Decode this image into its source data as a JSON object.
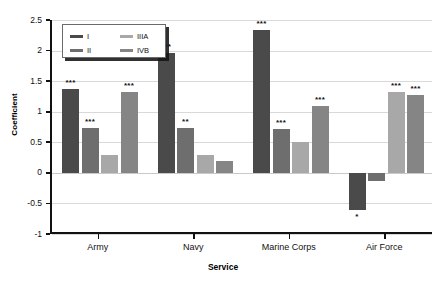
{
  "chart_data": {
    "type": "bar",
    "title": "",
    "xlabel": "Service",
    "ylabel": "Coefficient",
    "categories": [
      "Army",
      "Navy",
      "Marine Corps",
      "Air Force"
    ],
    "ylim": [
      -1,
      2.5
    ],
    "yticks": [
      2.5,
      2,
      1.5,
      1,
      0.5,
      0,
      -0.5,
      -1
    ],
    "ytick_labels": [
      "2.5",
      "2",
      "1.5",
      "1",
      "0.5",
      "0",
      "-0.5",
      "-1"
    ],
    "grid": true,
    "legend_position": "top-left",
    "series": [
      {
        "name": "I",
        "color": "#4a4a4a",
        "values": [
          1.37,
          1.96,
          2.34,
          -0.61
        ],
        "significance": [
          "***",
          "***",
          "***",
          "*"
        ]
      },
      {
        "name": "II",
        "color": "#6e6e6e",
        "values": [
          0.74,
          0.73,
          0.72,
          -0.14
        ],
        "significance": [
          "***",
          "**",
          "***",
          ""
        ]
      },
      {
        "name": "IIIA",
        "color": "#a8a8a8",
        "values": [
          0.29,
          0.29,
          0.5,
          1.32
        ],
        "significance": [
          "",
          "",
          "",
          "***"
        ]
      },
      {
        "name": "IVB",
        "color": "#858585",
        "values": [
          1.33,
          0.19,
          1.1,
          1.28
        ],
        "significance": [
          "***",
          "",
          "***",
          "***"
        ]
      }
    ]
  },
  "legend": {
    "entries": [
      {
        "label": "I",
        "color": "#4a4a4a"
      },
      {
        "label": "II",
        "color": "#6e6e6e"
      },
      {
        "label": "IIIA",
        "color": "#a8a8a8"
      },
      {
        "label": "IVB",
        "color": "#858585"
      }
    ]
  }
}
